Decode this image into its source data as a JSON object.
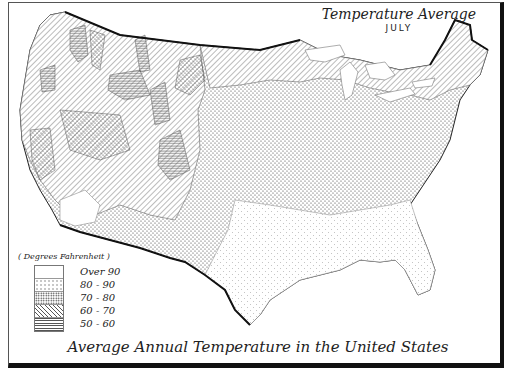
{
  "map": {
    "title": "Temperature Average",
    "subtitle": "JULY",
    "caption": "Average Annual Temperature in the United States",
    "legend": {
      "heading": "( Degrees Fahrenheit )",
      "items": [
        {
          "label": "Over 90",
          "pattern": "blank"
        },
        {
          "label": "80 - 90",
          "pattern": "sparse-dots"
        },
        {
          "label": "70 - 80",
          "pattern": "dense-dots"
        },
        {
          "label": "60 - 70",
          "pattern": "diagonal-hatch"
        },
        {
          "label": "50 - 60",
          "pattern": "horizontal-hatch"
        }
      ]
    },
    "regions": [
      {
        "name": "Northwest & Mountain West",
        "band": "60 - 70"
      },
      {
        "name": "High Rockies",
        "band": "50 - 60"
      },
      {
        "name": "Great Basin / California valleys",
        "band": "70 - 80"
      },
      {
        "name": "Desert Southwest",
        "band": "Over 90"
      },
      {
        "name": "Great Plains & Midwest",
        "band": "70 - 80"
      },
      {
        "name": "Upper Midwest & New England",
        "band": "60 - 70"
      },
      {
        "name": "Gulf Coast & Southeast",
        "band": "80 - 90"
      }
    ],
    "colors": {
      "ink": "#222222",
      "paper": "#ffffff",
      "border": "#111111"
    }
  }
}
